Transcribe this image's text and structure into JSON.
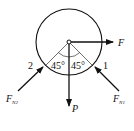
{
  "diagram": {
    "type": "free-body-diagram",
    "forces": {
      "F": {
        "label": "F"
      },
      "P": {
        "label": "P"
      },
      "FN1": {
        "label": "F",
        "sub": "N1"
      },
      "FN2": {
        "label": "F",
        "sub": "N2"
      }
    },
    "points": {
      "p1": "1",
      "p2": "2"
    },
    "angles": {
      "left": "45°",
      "right": "45°"
    },
    "colors": {
      "stroke": "#111111",
      "background": "#ffffff"
    }
  }
}
